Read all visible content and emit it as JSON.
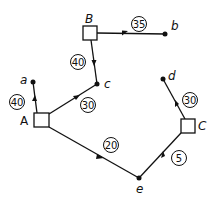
{
  "diagram": {
    "type": "flow-network",
    "colors": {
      "stroke": "#111111",
      "background": "#ffffff"
    },
    "sources": [
      {
        "id": "A",
        "label": "A",
        "x": 41,
        "y": 120
      },
      {
        "id": "B",
        "label": "B",
        "x": 90,
        "y": 33
      },
      {
        "id": "C",
        "label": "C",
        "x": 188,
        "y": 126
      }
    ],
    "sinks": [
      {
        "id": "a",
        "label": "a",
        "x": 33,
        "y": 82
      },
      {
        "id": "b",
        "label": "b",
        "x": 165,
        "y": 34
      },
      {
        "id": "c",
        "label": "c",
        "x": 97,
        "y": 84
      },
      {
        "id": "d",
        "label": "d",
        "x": 163,
        "y": 79
      },
      {
        "id": "e",
        "label": "e",
        "x": 139,
        "y": 178
      }
    ],
    "edges": [
      {
        "from": "B",
        "to": "b",
        "weight": "35"
      },
      {
        "from": "B",
        "to": "c",
        "weight": "40"
      },
      {
        "from": "A",
        "to": "a",
        "weight": "40"
      },
      {
        "from": "A",
        "to": "c",
        "weight": "30"
      },
      {
        "from": "A",
        "to": "e",
        "weight": "20"
      },
      {
        "from": "C",
        "to": "d",
        "weight": "30"
      },
      {
        "from": "C",
        "to": "e",
        "weight": "5"
      }
    ]
  }
}
